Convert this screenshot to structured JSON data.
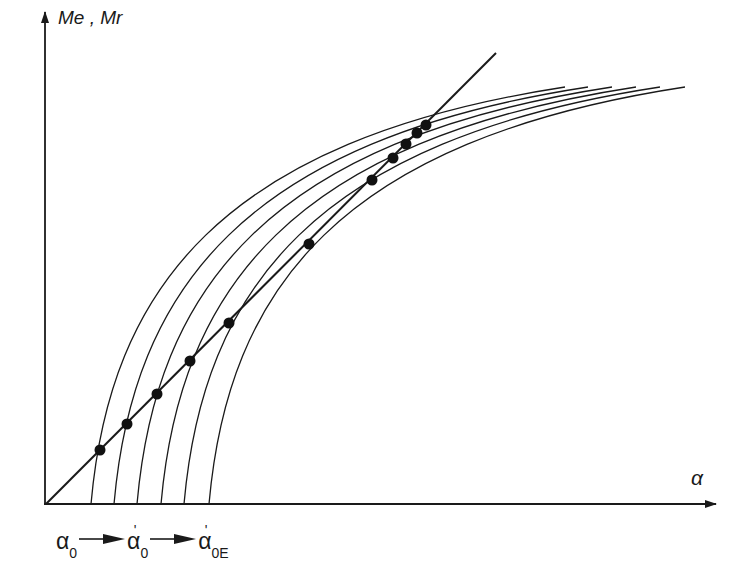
{
  "diagram": {
    "y_axis_label": "Me , Mr",
    "x_axis_label": "α",
    "sequence": [
      {
        "symbol": "α",
        "sub": "0",
        "prime": false
      },
      {
        "symbol": "α",
        "sub": "0",
        "prime": true
      },
      {
        "symbol": "α",
        "sub": "0E",
        "prime": true
      }
    ],
    "colors": {
      "stroke": "#1a1a1a",
      "background": "#ffffff"
    },
    "curves": {
      "count": 6,
      "start_x": [
        91,
        114,
        137,
        161,
        184,
        209
      ],
      "end_x": [
        565,
        588,
        612,
        636,
        660,
        685
      ]
    },
    "line": {
      "from": [
        46,
        504
      ],
      "to": [
        496,
        53
      ]
    },
    "points": [
      [
        100,
        450
      ],
      [
        127,
        424
      ],
      [
        157,
        394
      ],
      [
        190,
        361
      ],
      [
        229,
        323
      ],
      [
        309,
        244
      ],
      [
        372,
        180
      ],
      [
        393,
        158
      ],
      [
        406,
        144
      ],
      [
        417,
        133
      ],
      [
        426,
        125
      ]
    ]
  }
}
